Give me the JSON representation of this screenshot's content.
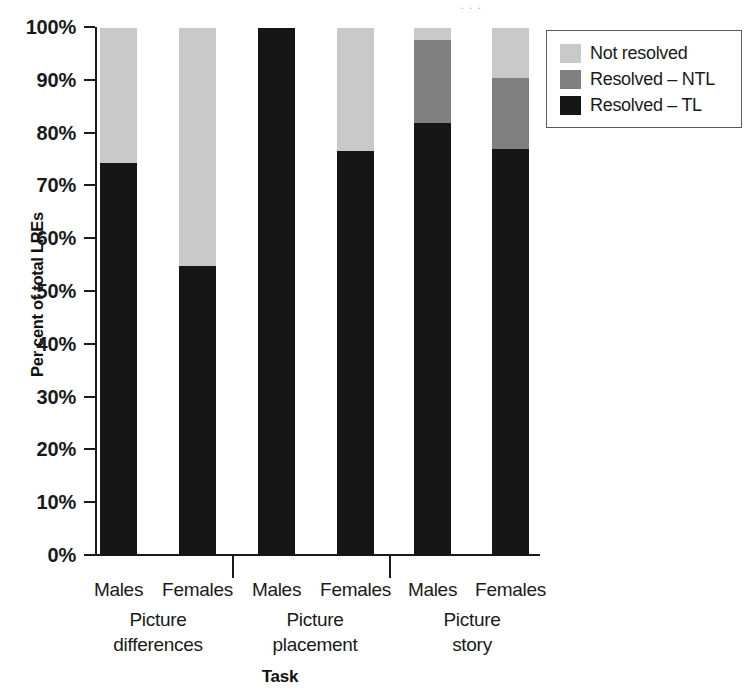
{
  "figure": {
    "scan_artifact_text": "·  ·   ·"
  },
  "chart_data": {
    "type": "bar",
    "subtype": "stacked-bar-100-percent",
    "title": "",
    "xlabel": "Task",
    "ylabel": "Per cent of total LREs",
    "ylim": [
      0,
      100
    ],
    "ytick_labels": [
      "100%",
      "90%",
      "80%",
      "70%",
      "60%",
      "50%",
      "40%",
      "30%",
      "20%",
      "10%",
      "0%"
    ],
    "ytick_values": [
      100,
      90,
      80,
      70,
      60,
      50,
      40,
      30,
      20,
      10,
      0
    ],
    "grid": false,
    "legend_position": "top-right",
    "categories": [
      "Males",
      "Females",
      "Males",
      "Females",
      "Males",
      "Females"
    ],
    "groups": [
      {
        "label_line1": "Picture",
        "label_line2": "differences",
        "categories": [
          "Males",
          "Females"
        ]
      },
      {
        "label_line1": "Picture",
        "label_line2": "placement",
        "categories": [
          "Males",
          "Females"
        ]
      },
      {
        "label_line1": "Picture",
        "label_line2": "story",
        "categories": [
          "Males",
          "Females"
        ]
      }
    ],
    "series": [
      {
        "name": "Resolved – TL",
        "color": "#161616",
        "values": [
          74.5,
          55.0,
          100.0,
          76.8,
          82.0,
          77.0
        ]
      },
      {
        "name": "Resolved – NTL",
        "color": "#808080",
        "values": [
          0.0,
          0.0,
          0.0,
          0.0,
          15.7,
          13.5
        ]
      },
      {
        "name": "Not resolved",
        "color": "#c9c9c9",
        "values": [
          25.5,
          45.0,
          0.0,
          23.2,
          2.3,
          9.5
        ]
      }
    ],
    "legend": [
      {
        "label": "Not resolved",
        "color": "#c9c9c9"
      },
      {
        "label": "Resolved – NTL",
        "color": "#808080"
      },
      {
        "label": "Resolved – TL",
        "color": "#161616"
      }
    ]
  }
}
